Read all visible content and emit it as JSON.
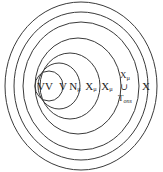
{
  "diagram": {
    "type": "nested-euler-diagram",
    "background_color": "#ffffff",
    "stroke_color": "#3a3a3a",
    "text_color": "#1c1c1c",
    "center": {
      "x": 81,
      "y": 86
    },
    "rings": [
      {
        "index": 0,
        "name": "outermost",
        "rx": 76,
        "ry": 84,
        "label": "X",
        "label_x": 145,
        "label_y": 86,
        "label_kind": "plain"
      },
      {
        "index": 1,
        "name": "second",
        "rx": 67,
        "ry": 74,
        "label_line1": "X",
        "label_sub1": "μ",
        "label_union": "∪",
        "label_line2": "T",
        "label_sub2": "ons",
        "label_x": 124,
        "label_y": 86,
        "label_kind": "stacked-union"
      },
      {
        "index": 2,
        "name": "third",
        "rx": 58,
        "ry": 64,
        "label_base": "X",
        "label_sub": "μ",
        "label_x": 107,
        "label_y": 86,
        "label_kind": "subscripted"
      },
      {
        "index": 3,
        "name": "fourth",
        "rx": 43,
        "ry": 48,
        "label_base": "X",
        "label_sub": "μ",
        "label_x": 91,
        "label_y": 86,
        "label_kind": "subscripted"
      },
      {
        "index": 4,
        "name": "fifth",
        "rx": 30,
        "ry": 33,
        "label_base": "N",
        "label_sub": "μ",
        "label_x": 75,
        "label_y": 86,
        "label_kind": "subscripted"
      },
      {
        "index": 5,
        "name": "sixth",
        "rx": 21,
        "ry": 23,
        "label": "V",
        "label_x": 61,
        "label_y": 86,
        "label_kind": "plain"
      },
      {
        "index": 6,
        "name": "innermost",
        "rx": 14,
        "ry": 15,
        "label": "VV",
        "label_x": 45,
        "label_y": 86,
        "label_kind": "plain"
      }
    ]
  }
}
